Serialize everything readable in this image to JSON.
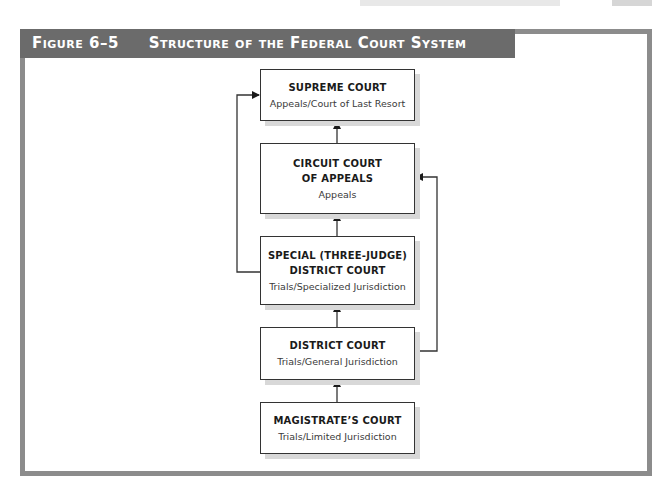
{
  "figure": {
    "number": "Figure 6–5",
    "title": "Structure of the Federal Court System"
  },
  "courts": [
    {
      "id": "supreme",
      "title_lines": [
        "SUPREME COURT"
      ],
      "subtitle": "Appeals/Court of Last Resort"
    },
    {
      "id": "circuit",
      "title_lines": [
        "CIRCUIT COURT",
        "OF APPEALS"
      ],
      "subtitle": "Appeals"
    },
    {
      "id": "special",
      "title_lines": [
        "SPECIAL (THREE-JUDGE)",
        "DISTRICT COURT"
      ],
      "subtitle": "Trials/Specialized Jurisdiction"
    },
    {
      "id": "district",
      "title_lines": [
        "DISTRICT COURT"
      ],
      "subtitle": "Trials/General Jurisdiction"
    },
    {
      "id": "magistrate",
      "title_lines": [
        "MAGISTRATE’S COURT"
      ],
      "subtitle": "Trials/Limited Jurisdiction"
    }
  ],
  "connections": [
    {
      "from": "magistrate",
      "to": "district"
    },
    {
      "from": "district",
      "to": "special"
    },
    {
      "from": "special",
      "to": "circuit"
    },
    {
      "from": "circuit",
      "to": "supreme"
    },
    {
      "from": "special",
      "to": "supreme",
      "route": "left"
    },
    {
      "from": "district",
      "to": "circuit",
      "route": "right"
    }
  ],
  "colors": {
    "header_bar": "#6b6b6b",
    "frame_border": "#8c8c8c",
    "box_border": "#333333",
    "box_shadow": "#d8d8d8",
    "line": "#333333"
  }
}
